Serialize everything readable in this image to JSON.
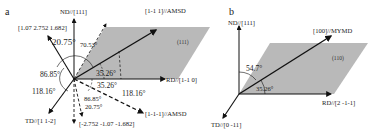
{
  "figure": {
    "panels": [
      {
        "id": "a",
        "label": "a",
        "plane_label": "(111)",
        "axes": {
          "nd": "ND//[111]",
          "rd": "RD//[1-1 0]",
          "td": "TD//[1 1-2]"
        },
        "vectors": {
          "amsd_up": "[1-1 1]//AMSD",
          "amsd_down": "[1-1-1]//AMSD",
          "upper_left": "[1.07 2.752 1.682]",
          "lower": "[-2.752  -1.07  -1.682]"
        },
        "angles": {
          "upper_left_from_nd": "20.75°",
          "dashed_from_nd": "70.53°",
          "amsd_from_rd": "35.26°",
          "left_upper": "86.85°",
          "left_lower": "118.16°",
          "amsd_down_from_rd": "35.26°",
          "amsd_down_right": "118.16°",
          "lower_a": "86.85°",
          "lower_b": "20.75°"
        }
      },
      {
        "id": "b",
        "label": "b",
        "plane_label": "(110)",
        "axes": {
          "nd": "ND//[111]",
          "rd": "RD//[2 -1-1]",
          "td": "TD//[0 -11]"
        },
        "vectors": {
          "mymd": "[100]//MYMD"
        },
        "angles": {
          "from_nd": "54.7°",
          "from_rd": "35.26°"
        }
      }
    ],
    "colors": {
      "plane_fill": "#b9b9b9",
      "line": "#111111"
    }
  }
}
